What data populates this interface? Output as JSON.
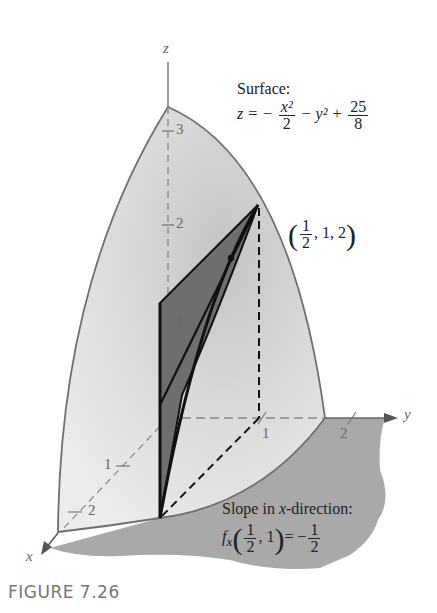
{
  "figure": {
    "caption": "FIGURE 7.26",
    "axes": {
      "x_label": "x",
      "y_label": "y",
      "z_label": "z",
      "z_ticks": [
        "3",
        "2",
        "1"
      ],
      "y_ticks": [
        "1",
        "2"
      ],
      "x_ticks": [
        "1",
        "2"
      ]
    },
    "surface_annotation": {
      "title": "Surface:",
      "lhs": "z = −",
      "frac1_num": "x²",
      "frac1_den": "2",
      "mid": "− y² +",
      "frac2_num": "25",
      "frac2_den": "8"
    },
    "point_annotation": {
      "open": "(",
      "frac_num": "1",
      "frac_den": "2",
      "rest": ", 1, 2",
      "close": ")"
    },
    "slope_annotation": {
      "title_prefix": "Slope in ",
      "title_var": "x",
      "title_suffix": "-direction:",
      "func": "f",
      "sub": "x",
      "open": "(",
      "frac_num": "1",
      "frac_den": "2",
      "rest": ", 1",
      "close": ")",
      "equals": "= −",
      "val_num": "1",
      "val_den": "2"
    },
    "colors": {
      "surface_light": "#e4e4e4",
      "surface_mid": "#cfcfcf",
      "ground": "#a9a9a9",
      "tangent_fill": "#6e6e6e",
      "outline": "#707070",
      "dark": "#111111"
    }
  }
}
